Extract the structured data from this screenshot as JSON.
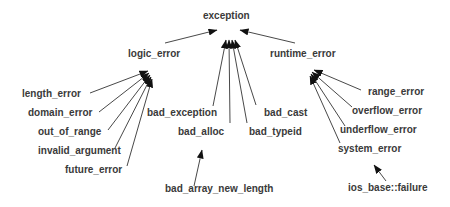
{
  "diagram": {
    "root": "exception",
    "nodes": {
      "exception": "exception",
      "logic_error": "logic_error",
      "runtime_error": "runtime_error",
      "length_error": "length_error",
      "domain_error": "domain_error",
      "out_of_range": "out_of_range",
      "invalid_argument": "invalid_argument",
      "future_error": "future_error",
      "bad_exception": "bad_exception",
      "bad_alloc": "bad_alloc",
      "bad_cast": "bad_cast",
      "bad_typeid": "bad_typeid",
      "bad_array_new_length": "bad_array_new_length",
      "range_error": "range_error",
      "overflow_error": "overflow_error",
      "underflow_error": "underflow_error",
      "system_error": "system_error",
      "ios_base_failure": "ios_base::failure"
    },
    "edges": [
      [
        "logic_error",
        "exception"
      ],
      [
        "runtime_error",
        "exception"
      ],
      [
        "bad_exception",
        "exception"
      ],
      [
        "bad_alloc",
        "exception"
      ],
      [
        "bad_typeid",
        "exception"
      ],
      [
        "bad_cast",
        "exception"
      ],
      [
        "length_error",
        "logic_error"
      ],
      [
        "domain_error",
        "logic_error"
      ],
      [
        "out_of_range",
        "logic_error"
      ],
      [
        "invalid_argument",
        "logic_error"
      ],
      [
        "future_error",
        "logic_error"
      ],
      [
        "bad_array_new_length",
        "bad_alloc"
      ],
      [
        "range_error",
        "runtime_error"
      ],
      [
        "overflow_error",
        "runtime_error"
      ],
      [
        "underflow_error",
        "runtime_error"
      ],
      [
        "system_error",
        "runtime_error"
      ],
      [
        "ios_base_failure",
        "system_error"
      ]
    ],
    "colors": {
      "text": "#3a3a3a",
      "line": "#333333",
      "arrow": "#111111"
    }
  }
}
